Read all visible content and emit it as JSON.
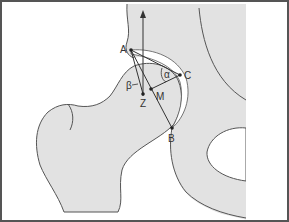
{
  "diagram": {
    "colors": {
      "bone": "#e2e2e2",
      "outline": "#555555",
      "line": "#333333",
      "frame": "#555555",
      "background": "#ffffff"
    },
    "points": [
      {
        "id": "A",
        "label": "A",
        "x": 131,
        "y": 50
      },
      {
        "id": "B",
        "label": "B",
        "x": 172,
        "y": 128
      },
      {
        "id": "C",
        "label": "C",
        "x": 180,
        "y": 75
      },
      {
        "id": "M",
        "label": "M",
        "x": 151,
        "y": 89
      },
      {
        "id": "Z",
        "label": "Z",
        "x": 143,
        "y": 94
      }
    ],
    "angles": [
      {
        "id": "alpha",
        "label": "α"
      },
      {
        "id": "beta",
        "label": "β"
      }
    ]
  }
}
